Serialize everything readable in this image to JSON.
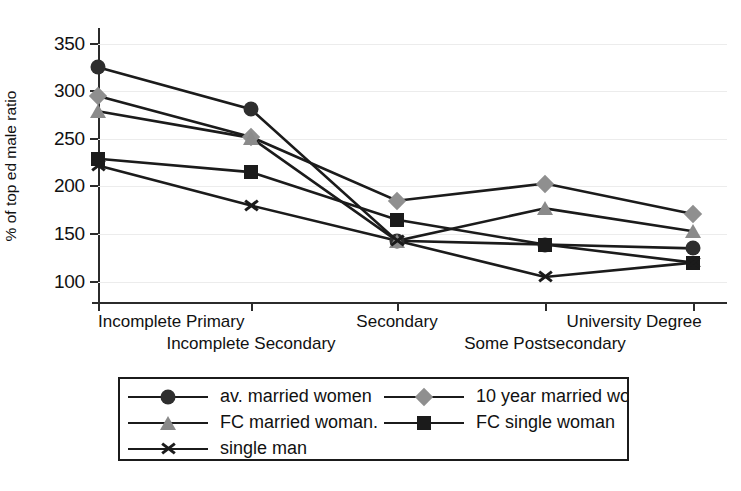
{
  "chart_data": {
    "type": "line",
    "title": "",
    "xlabel": "",
    "ylabel": "% of top ed male ratio",
    "categories": [
      "Incomplete Primary",
      "Incomplete Secondary",
      "Secondary",
      "Some Postsecondary",
      "University Degree"
    ],
    "ylim": [
      85,
      360
    ],
    "yticks": [
      100,
      150,
      200,
      250,
      300,
      350
    ],
    "ytick_labels": [
      "100",
      "150",
      "200",
      "250",
      "300",
      "350"
    ],
    "grid": true,
    "legend_position": "below-center",
    "series": [
      {
        "name": "av. married women",
        "marker": "circle",
        "color": "#2e2e2e",
        "values": [
          325,
          281,
          143,
          139,
          135
        ]
      },
      {
        "name": "10 year married woman",
        "marker": "diamond",
        "color": "#8f8f8f",
        "values": [
          295,
          252,
          185,
          203,
          171
        ]
      },
      {
        "name": "FC married woman.",
        "marker": "triangle",
        "color": "#8a8a8a",
        "values": [
          279,
          251,
          143,
          177,
          153
        ]
      },
      {
        "name": "FC single woman",
        "marker": "square",
        "color": "#1b1b1b",
        "values": [
          229,
          215,
          165,
          139,
          120
        ]
      },
      {
        "name": "single man",
        "marker": "cross",
        "color": "#1b1b1b",
        "values": [
          222,
          180,
          143,
          105,
          120
        ]
      }
    ]
  },
  "axis": {
    "y_label": "% of top ed male ratio",
    "tick_100": "100",
    "tick_150": "150",
    "tick_200": "200",
    "tick_250": "250",
    "tick_300": "300",
    "tick_350": "350",
    "cat_1": "Incomplete Primary",
    "cat_2": "Incomplete Secondary",
    "cat_3": "Secondary",
    "cat_4": "Some Postsecondary",
    "cat_5": "University Degree"
  },
  "legend": {
    "entries": [
      {
        "label": "av. married women",
        "marker": "circle"
      },
      {
        "label": "10 year married woman",
        "marker": "diamond"
      },
      {
        "label": "FC married woman.",
        "marker": "triangle"
      },
      {
        "label": "FC single woman",
        "marker": "square"
      },
      {
        "label": "single man",
        "marker": "cross"
      }
    ]
  }
}
